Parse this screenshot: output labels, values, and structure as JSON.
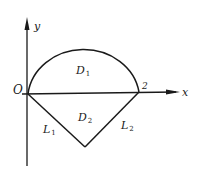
{
  "diagram": {
    "axes": {
      "x_label": "x",
      "y_label": "y",
      "origin_label": "O"
    },
    "points": {
      "right_intercept_label": "2"
    },
    "regions": [
      {
        "name": "D",
        "sub": "1",
        "description": "upper semicircle region"
      },
      {
        "name": "D",
        "sub": "2",
        "description": "lower triangle region"
      }
    ],
    "lines": [
      {
        "name": "L",
        "sub": "1"
      },
      {
        "name": "L",
        "sub": "2"
      }
    ],
    "colors": {
      "stroke": "#1a1a1a",
      "background": "#ffffff"
    }
  }
}
